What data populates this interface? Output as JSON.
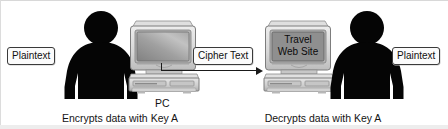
{
  "diagram": {
    "title_absent": true,
    "labels": {
      "plaintext_left": "Plaintext",
      "cipher_text": "Cipher Text",
      "plaintext_right": "Plaintext"
    },
    "captions": {
      "pc": "PC",
      "encrypt": "Encrypts data with Key A",
      "decrypt": "Decrypts data with Key A"
    },
    "screen": {
      "line1": "Travel",
      "line2": "Web Site"
    },
    "icons": {
      "person_left": "person-silhouette-icon",
      "person_right": "person-silhouette-icon",
      "computer_left": "desktop-computer-icon",
      "computer_right": "desktop-computer-icon",
      "flow": "arrow-right-icon"
    },
    "colors": {
      "silhouette": "#050505",
      "case_light": "#e3e3e3",
      "case_mid": "#c4c4c4",
      "case_dark": "#9a9a9a",
      "screen_left": "#9d9d9d",
      "screen_right": "#8f8f8f",
      "line": "#1a1a1a",
      "text": "#141414",
      "tag_fill": "#fbfbfb",
      "tag_border": "#3a3a3a"
    }
  }
}
